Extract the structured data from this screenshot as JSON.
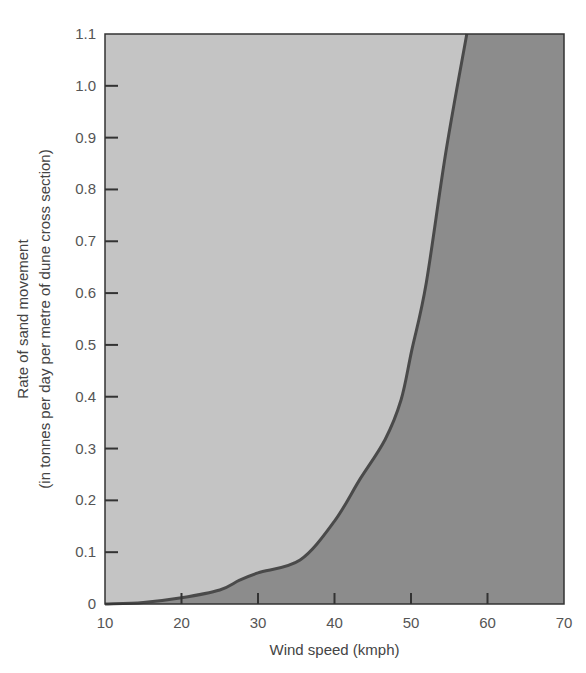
{
  "chart_data": {
    "type": "area",
    "title": "",
    "xlabel": "Wind speed (kmph)",
    "ylabel_line1": "Rate of sand movement",
    "ylabel_line2": "(in tonnes per day per metre of dune cross section)",
    "xlim": [
      10,
      70
    ],
    "ylim": [
      0,
      1.1
    ],
    "x_ticks": [
      10,
      20,
      30,
      40,
      50,
      60,
      70
    ],
    "x_tick_labels": [
      "10",
      "20",
      "30",
      "40",
      "50",
      "60",
      "70"
    ],
    "y_ticks": [
      0,
      0.1,
      0.2,
      0.3,
      0.4,
      0.5,
      0.6,
      0.7,
      0.8,
      0.9,
      1.0,
      1.1
    ],
    "y_tick_labels": [
      "0",
      "0.1",
      "0.2",
      "0.3",
      "0.4",
      "0.5",
      "0.6",
      "0.7",
      "0.8",
      "0.9",
      "1.0",
      "1.1"
    ],
    "grid": false,
    "legend": null,
    "series": [
      {
        "name": "Rate of sand movement",
        "x": [
          10,
          15,
          20,
          25,
          27.6,
          30,
          35.5,
          40,
          43.3,
          46.6,
          48.7,
          50.1,
          52,
          54.6,
          57.3
        ],
        "y": [
          0,
          0.003,
          0.012,
          0.027,
          0.046,
          0.06,
          0.085,
          0.16,
          0.24,
          0.317,
          0.394,
          0.49,
          0.62,
          0.876,
          1.1
        ]
      }
    ],
    "colors": {
      "upper_fill": "#c4c4c4",
      "lower_fill": "#8c8c8c",
      "curve": "#4a4a4a",
      "axis": "#333333"
    }
  }
}
